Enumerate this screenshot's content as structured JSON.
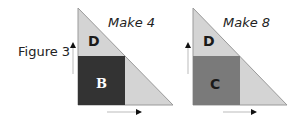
{
  "figure_label": "Figure 3",
  "panels": [
    {
      "title": "Make 4",
      "top_region_label": "D",
      "square_label": "B",
      "triangle_color": "#d4d4d4",
      "square_color": "#333333",
      "square_label_color": "#ffffff"
    },
    {
      "title": "Make 8",
      "top_region_label": "D",
      "square_label": "C",
      "triangle_color": "#d4d4d4",
      "square_color": "#7a7a7a",
      "square_label_color": "#1a1a1a"
    }
  ],
  "colors": {
    "edge": "#9a9a9a",
    "arrow": "#111111"
  }
}
